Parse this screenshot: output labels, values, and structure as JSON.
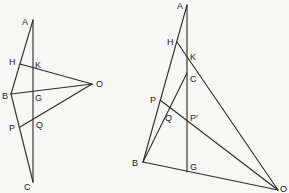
{
  "figures": [
    {
      "name": "left",
      "labels": {
        "A": "A",
        "H": "H",
        "K": "K",
        "B": "B",
        "G": "G",
        "O": "O",
        "P": "P",
        "Q": "Q",
        "C": "C"
      }
    },
    {
      "name": "right",
      "labels": {
        "A": "A",
        "H": "H",
        "K": "K",
        "C": "C",
        "P": "P",
        "Q": "Q",
        "Pp": "P′",
        "B": "B",
        "G": "G",
        "O": "O"
      }
    }
  ]
}
